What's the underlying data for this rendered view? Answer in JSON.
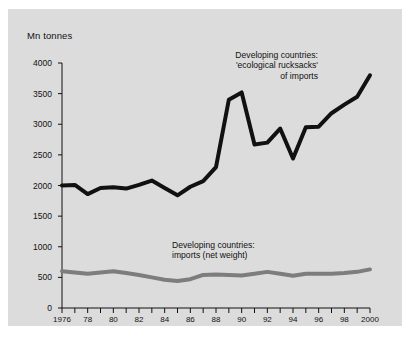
{
  "figure": {
    "background_color": "#ffffff",
    "panel_color": "#dcdcdc"
  },
  "axes": {
    "y_unit_label": "Mn tonnes",
    "y_ticks": [
      0,
      500,
      1000,
      1500,
      2000,
      2500,
      3000,
      3500,
      4000
    ],
    "y_tick_labels": [
      "0",
      "500",
      "1000",
      "1500",
      "2000",
      "2500",
      "3000",
      "3500",
      "4000"
    ],
    "x_ticks": [
      1976,
      1977,
      1978,
      1979,
      1980,
      1981,
      1982,
      1983,
      1984,
      1985,
      1986,
      1987,
      1988,
      1989,
      1990,
      1991,
      1992,
      1993,
      1994,
      1995,
      1996,
      1997,
      1998,
      1999,
      2000
    ],
    "x_tick_labels": [
      {
        "year": 1976,
        "label": "1976"
      },
      {
        "year": 1978,
        "label": "78"
      },
      {
        "year": 1980,
        "label": "80"
      },
      {
        "year": 1982,
        "label": "82"
      },
      {
        "year": 1984,
        "label": "84"
      },
      {
        "year": 1986,
        "label": "86"
      },
      {
        "year": 1988,
        "label": "88"
      },
      {
        "year": 1990,
        "label": "90"
      },
      {
        "year": 1992,
        "label": "92"
      },
      {
        "year": 1994,
        "label": "94"
      },
      {
        "year": 1996,
        "label": "96"
      },
      {
        "year": 1998,
        "label": "98"
      },
      {
        "year": 2000,
        "label": "2000"
      }
    ]
  },
  "annotations": {
    "rucksacks": "Developing countries:\n'ecological rucksacks'\nof imports",
    "net_weight": "Developing countries:\nimports (net weight)"
  },
  "chart_data": {
    "type": "line",
    "title": "",
    "xlabel": "",
    "ylabel": "Mn tonnes",
    "xlim": [
      1976,
      2000
    ],
    "ylim": [
      0,
      4000
    ],
    "grid": false,
    "legend_position": "inline-annotations",
    "x": [
      1976,
      1977,
      1978,
      1979,
      1980,
      1981,
      1982,
      1983,
      1984,
      1985,
      1986,
      1987,
      1988,
      1989,
      1990,
      1991,
      1992,
      1993,
      1994,
      1995,
      1996,
      1997,
      1998,
      1999,
      2000
    ],
    "series": [
      {
        "name": "Developing countries: 'ecological rucksacks' of imports",
        "color": "#111111",
        "line_width": 4,
        "values": [
          2000,
          2010,
          1860,
          1960,
          1970,
          1950,
          2010,
          2080,
          1960,
          1840,
          1980,
          2070,
          2300,
          3400,
          3520,
          2670,
          2700,
          2930,
          2440,
          2950,
          2960,
          3180,
          3320,
          3450,
          3800
        ]
      },
      {
        "name": "Developing countries: imports (net weight)",
        "color": "#7d7d7d",
        "line_width": 4,
        "values": [
          600,
          580,
          560,
          580,
          600,
          570,
          540,
          500,
          460,
          440,
          470,
          540,
          545,
          540,
          530,
          560,
          590,
          560,
          525,
          560,
          560,
          560,
          570,
          590,
          630
        ]
      }
    ]
  }
}
